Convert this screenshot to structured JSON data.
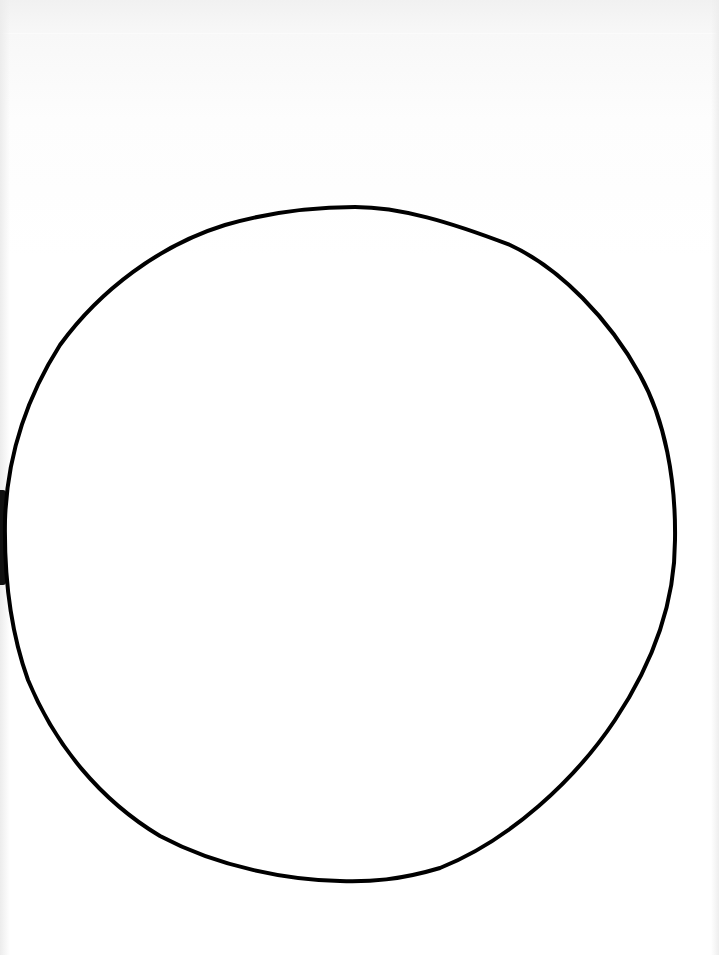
{
  "page": {
    "background": "#ffffff"
  },
  "shapes": [
    {
      "type": "circle-outline",
      "stroke": "#000000",
      "stroke_width": 4,
      "bounds": {
        "left": 5,
        "top": 207,
        "right": 675,
        "bottom": 882
      }
    }
  ]
}
